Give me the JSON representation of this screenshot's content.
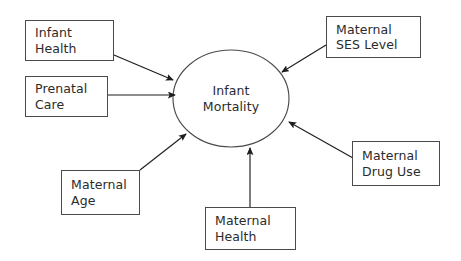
{
  "diagram": {
    "type": "influence-diagram",
    "background_color": "#ffffff",
    "stroke_color": "#4a4a4a",
    "text_color": "#2b2b2b",
    "center_node": {
      "id": "infant-mortality",
      "shape": "ellipse",
      "line1": "Infant",
      "line2": "Mortality",
      "cx": 231,
      "cy": 98.5,
      "rx": 58,
      "ry": 48.5
    },
    "nodes": [
      {
        "id": "infant-health",
        "shape": "rectangle",
        "line1": "Infant",
        "line2": "Health",
        "x": 25,
        "y": 20,
        "width": 89,
        "height": 41
      },
      {
        "id": "prenatal-care",
        "shape": "rectangle",
        "line1": "Prenatal",
        "line2": "Care",
        "x": 25,
        "y": 76,
        "width": 83,
        "height": 41
      },
      {
        "id": "maternal-age",
        "shape": "rectangle",
        "line1": "Maternal",
        "line2": "Age",
        "x": 61,
        "y": 170,
        "width": 79,
        "height": 45
      },
      {
        "id": "maternal-health",
        "shape": "rectangle",
        "line1": "Maternal",
        "line2": "Health",
        "x": 205,
        "y": 207,
        "width": 91,
        "height": 43
      },
      {
        "id": "maternal-drug-use",
        "shape": "rectangle",
        "line1": "Maternal",
        "line2": "Drug Use",
        "x": 352,
        "y": 141,
        "width": 88,
        "height": 45
      },
      {
        "id": "maternal-ses-level",
        "shape": "rectangle",
        "line1": "Maternal",
        "line2": "SES Level",
        "x": 326,
        "y": 16,
        "width": 95,
        "height": 42
      }
    ],
    "edges": [
      {
        "id": "edge-infant-health",
        "from": "infant-health",
        "to": "infant-mortality",
        "x1": 114,
        "y1": 55,
        "x2": 173,
        "y2": 80
      },
      {
        "id": "edge-prenatal-care",
        "from": "prenatal-care",
        "to": "infant-mortality",
        "x1": 108,
        "y1": 95,
        "x2": 175,
        "y2": 95
      },
      {
        "id": "edge-maternal-age",
        "from": "maternal-age",
        "to": "infant-mortality",
        "x1": 140,
        "y1": 170,
        "x2": 186,
        "y2": 134
      },
      {
        "id": "edge-maternal-health",
        "from": "maternal-health",
        "to": "infant-mortality",
        "x1": 250,
        "y1": 207,
        "x2": 250,
        "y2": 148
      },
      {
        "id": "edge-maternal-drug-use",
        "from": "maternal-drug-use",
        "to": "infant-mortality",
        "x1": 353,
        "y1": 158,
        "x2": 289,
        "y2": 122
      },
      {
        "id": "edge-maternal-ses-level",
        "from": "maternal-ses-level",
        "to": "infant-mortality",
        "x1": 326,
        "y1": 45,
        "x2": 282,
        "y2": 72
      }
    ]
  }
}
